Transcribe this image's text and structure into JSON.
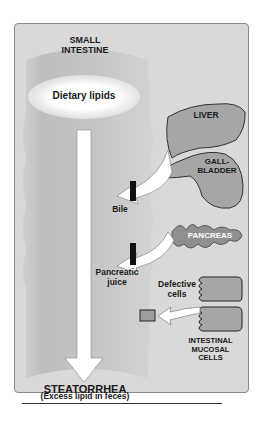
{
  "diagram": {
    "organ_main": {
      "line1": "SMALL",
      "line2": "INTESTINE"
    },
    "lipid_source": "Dietary lipids",
    "outcome": {
      "title": "STEATORRHEA",
      "subtitle": "(Excess lipid in feces)"
    },
    "organs": {
      "liver": "LIVER",
      "gallbladder": {
        "line1": "GALL-",
        "line2": "BLADDER"
      },
      "pancreas": "PANCREAS",
      "mucosa": {
        "line1": "INTESTINAL",
        "line2": "MUCOSAL",
        "line3": "CELLS"
      }
    },
    "inputs": {
      "bile": "Bile",
      "pancreatic": {
        "line1": "Pancreatic",
        "line2": "juice"
      },
      "defective": {
        "line1": "Defective",
        "line2": "cells"
      }
    },
    "colors": {
      "panel_bg": "#d9d9d9",
      "intestine": "#c4c4c4",
      "organ_fill": "#a6a6a6",
      "pancreas_fill": "#8f8f8f",
      "arrow": "#ffffff",
      "block": "#111111"
    }
  }
}
